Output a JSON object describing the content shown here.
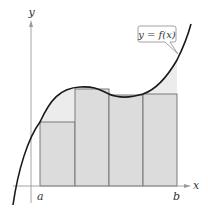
{
  "figure": {
    "axes": {
      "x_label": "x",
      "y_label": "y"
    },
    "points": {
      "a_label": "a",
      "b_label": "b"
    },
    "function_label": "y = f(x)",
    "rectangle_count": 4,
    "colors": {
      "rectangle_fill": "#dcdcdc",
      "rectangle_stroke": "#6e6e6e",
      "excess_region_fill": "#ececec",
      "curve": "#1a1a1a",
      "axis": "#9a9a9a",
      "label_box_stroke": "#8a8a8a"
    }
  }
}
